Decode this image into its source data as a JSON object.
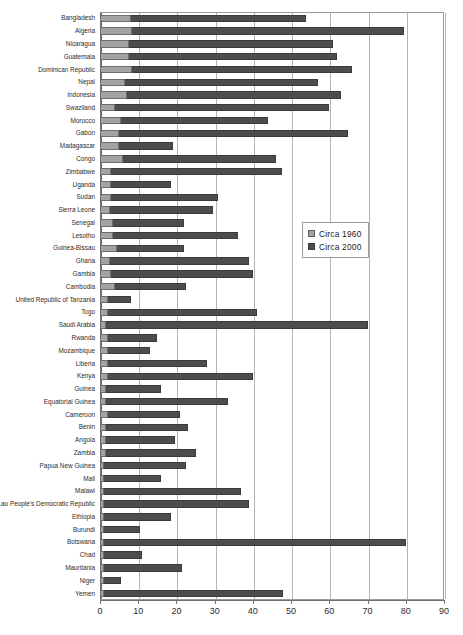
{
  "chart_data": {
    "type": "bar",
    "orientation": "horizontal",
    "title": "",
    "subtitle": "",
    "xlabel": "",
    "ylabel": "",
    "xlim": [
      0,
      90
    ],
    "xticks": [
      0,
      10,
      20,
      30,
      40,
      50,
      60,
      70,
      80,
      90
    ],
    "xticklabels": [
      "0",
      "10",
      "20",
      "30",
      "40",
      "50",
      "60",
      "70",
      "80",
      "90"
    ],
    "grid": true,
    "grid_axis": "x",
    "legend_position": "center-right",
    "colors": {
      "series_1960": "#a3a3a3",
      "series_2000": "#4d4d4d",
      "gridline": "#b4b4b4",
      "axis": "#6f6f6f",
      "plot_border": "#9a9a9a",
      "background": "#ffffff",
      "text": "#2b2b2b"
    },
    "categories": [
      "Bangladesh",
      "Algeria",
      "Nicaragua",
      "Guatemala",
      "Dominican Republic",
      "Nepal",
      "Indonesia",
      "Swaziland",
      "Morocco",
      "Gabon",
      "Madagascar",
      "Congo",
      "Zimbabwe",
      "Uganda",
      "Sudan",
      "Sierra Leone",
      "Senegal",
      "Lesotho",
      "Guinea-Bissau",
      "Ghana",
      "Gambia",
      "Cambodia",
      "United Republic of Tanzania",
      "Togo",
      "Saudi Arabia",
      "Rwanda",
      "Mozambique",
      "Liberia",
      "Kenya",
      "Guinea",
      "Equatorial Guinea",
      "Cameroon",
      "Benin",
      "Angola",
      "Zambia",
      "Papua New Guinea",
      "Mali",
      "Malawi",
      "Lao People's Democratic Republic",
      "Ethiopia",
      "Burundi",
      "Botswana",
      "Chad",
      "Mauritania",
      "Niger",
      "Yemen"
    ],
    "series": [
      {
        "name": "Circa 1960",
        "color": "#a3a3a3",
        "values": [
          8.0,
          8.5,
          7.5,
          7.5,
          8.5,
          6.5,
          7.0,
          4.0,
          5.5,
          5.0,
          5.0,
          6.0,
          3.0,
          3.0,
          3.0,
          2.5,
          3.5,
          3.5,
          4.5,
          2.5,
          3.0,
          4.0,
          2.0,
          2.0,
          1.5,
          2.0,
          2.0,
          2.0,
          2.0,
          1.5,
          1.5,
          2.0,
          1.5,
          1.5,
          1.5,
          1.0,
          1.0,
          1.0,
          1.0,
          1.0,
          1.0,
          1.0,
          1.0,
          1.0,
          1.0,
          1.0
        ]
      },
      {
        "name": "Circa 2000",
        "color": "#4d4d4d",
        "values": [
          54.0,
          79.5,
          61.0,
          62.0,
          66.0,
          57.0,
          63.0,
          60.0,
          44.0,
          65.0,
          19.0,
          46.0,
          47.5,
          18.5,
          31.0,
          29.5,
          22.0,
          36.0,
          22.0,
          39.0,
          40.0,
          22.5,
          8.0,
          41.0,
          70.0,
          15.0,
          13.0,
          28.0,
          40.0,
          16.0,
          33.5,
          21.0,
          23.0,
          19.5,
          25.0,
          22.5,
          16.0,
          37.0,
          39.0,
          18.5,
          10.5,
          80.0,
          11.0,
          21.5,
          5.5,
          48.0
        ]
      }
    ]
  },
  "legend": {
    "items": [
      {
        "label": "Circa 1960",
        "swatch": "s1960"
      },
      {
        "label": "Circa 2000",
        "swatch": "s2000"
      }
    ]
  }
}
